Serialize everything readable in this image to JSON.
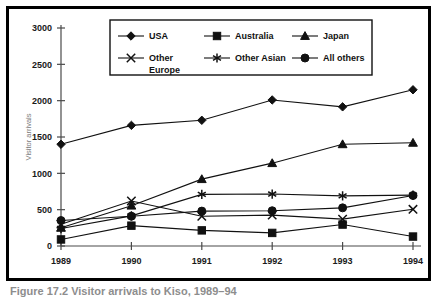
{
  "caption": "Figure 17.2   Visitor arrivals to Kiso, 1989–94",
  "chart_data": {
    "type": "line",
    "title": "",
    "xlabel": "Year",
    "ylabel": "Visitor arrivals",
    "categories": [
      "1989",
      "1990",
      "1991",
      "1992",
      "1993",
      "1994"
    ],
    "ylim": [
      0,
      3000
    ],
    "yticks": [
      0,
      500,
      1000,
      1500,
      2000,
      2500,
      3000
    ],
    "ytick_labels": [
      "0",
      "500",
      "1000",
      "1500",
      "2000",
      "2500",
      "3000"
    ],
    "grid": false,
    "legend_position": "top-inside",
    "series": [
      {
        "name": "USA",
        "marker": "diamond",
        "values": [
          1400,
          1660,
          1730,
          2010,
          1915,
          2150
        ]
      },
      {
        "name": "Australia",
        "marker": "square",
        "values": [
          90,
          280,
          215,
          180,
          295,
          130
        ]
      },
      {
        "name": "Japan",
        "marker": "triangle",
        "values": [
          250,
          555,
          920,
          1140,
          1400,
          1420
        ]
      },
      {
        "name": "Other Europe",
        "marker": "x",
        "values": [
          300,
          620,
          410,
          425,
          370,
          505
        ]
      },
      {
        "name": "Other Asian",
        "marker": "asterisk",
        "values": [
          240,
          415,
          710,
          715,
          690,
          700
        ]
      },
      {
        "name": "All others",
        "marker": "circle",
        "values": [
          350,
          410,
          480,
          485,
          525,
          695
        ]
      }
    ]
  }
}
